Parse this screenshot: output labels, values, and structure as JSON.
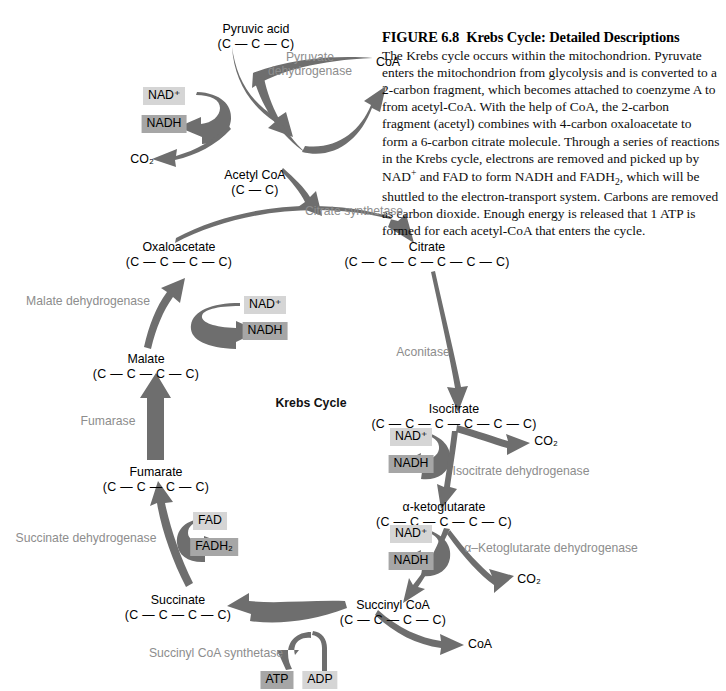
{
  "figure": {
    "number": "FIGURE 6.8",
    "title": "Krebs Cycle: Detailed Descriptions",
    "body": "The Krebs cycle occurs within the mitochondrion. Pyruvate enters the mitochondrion from glycolysis and is converted to a 2-carbon fragment, which becomes attached to coenzyme A to from acetyl-CoA. With the help of CoA, the 2-carbon fragment (acetyl) combines with 4-carbon oxaloacetate to form a 6-carbon citrate molecule. Through a series of reactions in the Krebs cycle, electrons are removed and picked up by NAD+ and FAD to form NADH and FADH2, which will be shuttled to the electron-transport system. Carbons are removed as carbon dioxide. Enough energy is released that 1 ATP is formed for each acetyl-CoA that enters the cycle."
  },
  "center_title": "Krebs Cycle",
  "metabolites": {
    "pyruvic_acid": {
      "name": "Pyruvic acid",
      "formula": "(C — C — C)"
    },
    "acetyl_coa": {
      "name": "Acetyl CoA",
      "formula": "(C — C)"
    },
    "oxaloacetate": {
      "name": "Oxaloacetate",
      "formula": "(C — C — C — C)"
    },
    "citrate": {
      "name": "Citrate",
      "formula": "(C — C — C — C — C — C)"
    },
    "isocitrate": {
      "name": "Isocitrate",
      "formula": "(C — C — C — C — C — C)"
    },
    "ketoglutarate": {
      "name": "α-ketoglutarate",
      "formula": "(C — C — C — C — C)"
    },
    "succinyl_coa": {
      "name": "Succinyl CoA",
      "formula": "(C — C — C — C)"
    },
    "succinate": {
      "name": "Succinate",
      "formula": "(C — C — C — C)"
    },
    "fumarate": {
      "name": "Fumarate",
      "formula": "(C — C — C — C)"
    },
    "malate": {
      "name": "Malate",
      "formula": "(C — C — C — C)"
    }
  },
  "enzymes": {
    "pyruvate_dehydrogenase": "Pyruvate\ndehydrogenase",
    "citrate_synthetase": "Citrate synthetase",
    "aconitase": "Aconitase",
    "isocitrate_dehydrogenase": "Isocitrate dehydrogenase",
    "ketoglutarate_dehydrogenase": "α–Ketoglutarate dehydrogenase",
    "succinyl_coa_synthetase": "Succinyl CoA synthetase",
    "succinate_dehydrogenase": "Succinate dehydrogenase",
    "fumarase": "Fumarase",
    "malate_dehydrogenase": "Malate dehydrogenase"
  },
  "coenzymes": {
    "nad_plus": "NAD⁺",
    "nadh": "NADH",
    "fad": "FAD",
    "fadh2": "FADH₂",
    "atp": "ATP",
    "adp": "ADP"
  },
  "byproducts": {
    "coa_top": "CoA",
    "coa_bottom": "CoA",
    "co2_top": "CO₂",
    "co2_isocitrate": "CO₂",
    "co2_ketoglutarate": "CO₂"
  },
  "colors": {
    "arrow_gray": "#6e6e6e",
    "enzyme_text": "#8d8d8d",
    "chip_light": "#d5d5d5",
    "chip_dark": "#a6a6a6",
    "text_black": "#000000"
  }
}
